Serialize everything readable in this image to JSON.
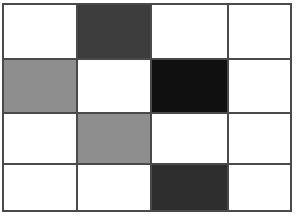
{
  "figure": {
    "type": "grid-pattern",
    "columns": 4,
    "rows": 4,
    "background_color": "#ffffff",
    "border_color": "#4a4a4a",
    "gridline_color": "#4a4a4a",
    "gridline_width_px": 2,
    "palette": {
      "white": "#ffffff",
      "light_gray": "#8e8e8e",
      "dark_gray": "#3c3c3c",
      "darker_gray": "#2e2e2e",
      "near_black": "#101010"
    },
    "cells": [
      {
        "row": 1,
        "col": 1,
        "shade": "white",
        "color": "#ffffff"
      },
      {
        "row": 1,
        "col": 2,
        "shade": "dark-gray",
        "color": "#3c3c3c"
      },
      {
        "row": 1,
        "col": 3,
        "shade": "white",
        "color": "#ffffff"
      },
      {
        "row": 1,
        "col": 4,
        "shade": "white",
        "color": "#ffffff"
      },
      {
        "row": 2,
        "col": 1,
        "shade": "light-gray",
        "color": "#8e8e8e"
      },
      {
        "row": 2,
        "col": 2,
        "shade": "white",
        "color": "#ffffff"
      },
      {
        "row": 2,
        "col": 3,
        "shade": "near-black",
        "color": "#101010"
      },
      {
        "row": 2,
        "col": 4,
        "shade": "white",
        "color": "#ffffff"
      },
      {
        "row": 3,
        "col": 1,
        "shade": "white",
        "color": "#ffffff"
      },
      {
        "row": 3,
        "col": 2,
        "shade": "light-gray",
        "color": "#8e8e8e"
      },
      {
        "row": 3,
        "col": 3,
        "shade": "white",
        "color": "#ffffff"
      },
      {
        "row": 3,
        "col": 4,
        "shade": "white",
        "color": "#ffffff"
      },
      {
        "row": 4,
        "col": 1,
        "shade": "white",
        "color": "#ffffff"
      },
      {
        "row": 4,
        "col": 2,
        "shade": "white",
        "color": "#ffffff"
      },
      {
        "row": 4,
        "col": 3,
        "shade": "darker-gray",
        "color": "#2e2e2e"
      },
      {
        "row": 4,
        "col": 4,
        "shade": "white",
        "color": "#ffffff"
      }
    ]
  }
}
